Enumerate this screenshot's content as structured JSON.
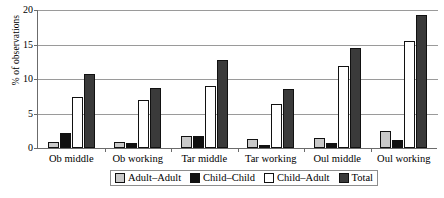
{
  "chart_data": {
    "type": "bar",
    "title": "",
    "xlabel": "",
    "ylabel": "% of observations",
    "ylim": [
      0,
      20
    ],
    "yticks": [
      0,
      5,
      10,
      15,
      20
    ],
    "grid": true,
    "legend_position": "bottom",
    "categories": [
      "Ob middle",
      "Ob working",
      "Tar middle",
      "Tar working",
      "Oul middle",
      "Oul working"
    ],
    "series": [
      {
        "name": "Adult–Adult",
        "color": "#c9c9c9",
        "values": [
          0.9,
          0.9,
          1.8,
          1.3,
          1.4,
          2.5
        ]
      },
      {
        "name": "Child–Child",
        "color": "#111111",
        "values": [
          2.2,
          0.7,
          1.7,
          0.5,
          0.7,
          1.1
        ]
      },
      {
        "name": "Child–Adult",
        "color": "#ffffff",
        "values": [
          7.4,
          7.0,
          9.0,
          6.4,
          11.9,
          15.5
        ]
      },
      {
        "name": "Total",
        "color": "#3a3a3a",
        "values": [
          10.7,
          8.7,
          12.7,
          8.5,
          14.5,
          19.3
        ]
      }
    ]
  }
}
